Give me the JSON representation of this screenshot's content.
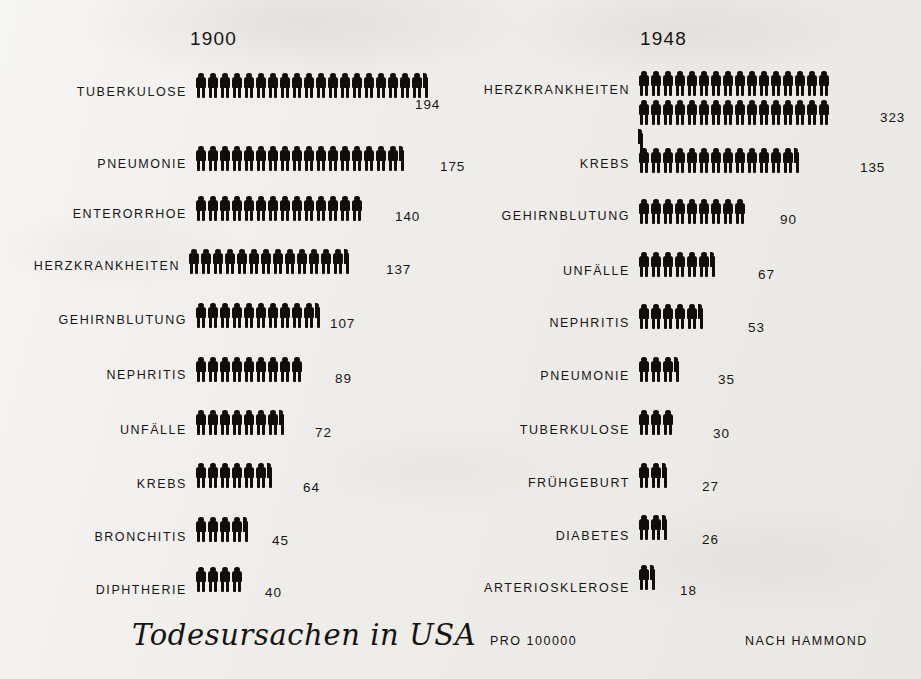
{
  "page": {
    "background_color": "#efedea",
    "ink_color": "#100e0c"
  },
  "headers": {
    "left": "1900",
    "right": "1948"
  },
  "footer": {
    "title": "Todesursachen in USA",
    "unit": "PRO 100000",
    "source": "NACH HAMMOND"
  },
  "chart_data": {
    "type": "bar",
    "subtype": "isotype-pictogram",
    "title": "Todesursachen in USA",
    "xlabel": "",
    "ylabel": "",
    "unit_note": "PRO 100000",
    "source_note": "NACH HAMMOND",
    "symbol": "human figure",
    "symbol_value": 10,
    "legend_position": "none",
    "grid": false,
    "series": [
      {
        "name": "1900",
        "categories": [
          "TUBERKULOSE",
          "PNEUMONIE",
          "ENTERORRHOE",
          "HERZKRANKHEITEN",
          "GEHIRNBLUTUNG",
          "NEPHRITIS",
          "UNFÄLLE",
          "KREBS",
          "BRONCHITIS",
          "DIPHTHERIE"
        ],
        "values": [
          194,
          175,
          140,
          137,
          107,
          89,
          72,
          64,
          45,
          40
        ]
      },
      {
        "name": "1948",
        "categories": [
          "HERZKRANKHEITEN",
          "KREBS",
          "GEHIRNBLUTUNG",
          "UNFÄLLE",
          "NEPHRITIS",
          "PNEUMONIE",
          "TUBERKULOSE",
          "FRÜHGEBURT",
          "DIABETES",
          "ARTERIOSKLEROSE"
        ],
        "values": [
          323,
          135,
          90,
          67,
          53,
          35,
          30,
          27,
          26,
          18
        ]
      }
    ]
  },
  "left_column": {
    "year": "1900",
    "rows": [
      {
        "label": "TUBERKULOSE",
        "value": "194",
        "full": 19,
        "half": 1,
        "top": 72,
        "fig_left": 195,
        "label_top": 86,
        "value_left": 415,
        "value_top": 97,
        "wrap": 0
      },
      {
        "label": "PNEUMONIE",
        "value": "175",
        "full": 17,
        "half": 1,
        "top": 145,
        "fig_left": 195,
        "label_top": 158,
        "value_left": 440,
        "value_top": 159,
        "wrap": 0
      },
      {
        "label": "ENTERORRHOE",
        "value": "140",
        "full": 14,
        "half": 0,
        "top": 195,
        "fig_left": 195,
        "label_top": 208,
        "value_left": 395,
        "value_top": 209,
        "wrap": 0
      },
      {
        "label": "HERZKRANKHEITEN",
        "value": "137",
        "full": 13,
        "half": 1,
        "top": 248,
        "fig_left": 188,
        "label_top": 260,
        "value_left": 386,
        "value_top": 262,
        "wrap": 0
      },
      {
        "label": "GEHIRNBLUTUNG",
        "value": "107",
        "full": 10,
        "half": 1,
        "top": 302,
        "fig_left": 195,
        "label_top": 314,
        "value_left": 330,
        "value_top": 316,
        "wrap": 0
      },
      {
        "label": "NEPHRITIS",
        "value": "89",
        "full": 9,
        "half": 0,
        "top": 356,
        "fig_left": 195,
        "label_top": 369,
        "value_left": 335,
        "value_top": 371,
        "wrap": 0
      },
      {
        "label": "UNFÄLLE",
        "value": "72",
        "full": 7,
        "half": 1,
        "top": 409,
        "fig_left": 195,
        "label_top": 424,
        "value_left": 315,
        "value_top": 425,
        "wrap": 0
      },
      {
        "label": "KREBS",
        "value": "64",
        "full": 6,
        "half": 1,
        "top": 462,
        "fig_left": 195,
        "label_top": 478,
        "value_left": 303,
        "value_top": 480,
        "wrap": 0
      },
      {
        "label": "BRONCHITIS",
        "value": "45",
        "full": 4,
        "half": 1,
        "top": 516,
        "fig_left": 195,
        "label_top": 531,
        "value_left": 272,
        "value_top": 533,
        "wrap": 0
      },
      {
        "label": "DIPHTHERIE",
        "value": "40",
        "full": 4,
        "half": 0,
        "top": 566,
        "fig_left": 195,
        "label_top": 584,
        "value_left": 265,
        "value_top": 585,
        "wrap": 0
      }
    ]
  },
  "right_column": {
    "year": "1948",
    "rows": [
      {
        "label": "HERZKRANKHEITEN",
        "value": "323",
        "full": 32,
        "half": 1,
        "top": 70,
        "fig_left": 168,
        "label_top": 84,
        "value_left": 410,
        "value_top": 110,
        "wrap": 16
      },
      {
        "label": "KREBS",
        "value": "135",
        "full": 13,
        "half": 1,
        "top": 147,
        "fig_left": 168,
        "label_top": 158,
        "value_left": 390,
        "value_top": 160,
        "wrap": 0
      },
      {
        "label": "GEHIRNBLUTUNG",
        "value": "90",
        "full": 9,
        "half": 0,
        "top": 198,
        "fig_left": 168,
        "label_top": 210,
        "value_left": 310,
        "value_top": 212,
        "wrap": 0
      },
      {
        "label": "UNFÄLLE",
        "value": "67",
        "full": 6,
        "half": 1,
        "top": 251,
        "fig_left": 168,
        "label_top": 265,
        "value_left": 288,
        "value_top": 267,
        "wrap": 0
      },
      {
        "label": "NEPHRITIS",
        "value": "53",
        "full": 5,
        "half": 1,
        "top": 303,
        "fig_left": 168,
        "label_top": 317,
        "value_left": 278,
        "value_top": 320,
        "wrap": 0
      },
      {
        "label": "PNEUMONIE",
        "value": "35",
        "full": 3,
        "half": 1,
        "top": 356,
        "fig_left": 168,
        "label_top": 370,
        "value_left": 248,
        "value_top": 372,
        "wrap": 0
      },
      {
        "label": "TUBERKULOSE",
        "value": "30",
        "full": 3,
        "half": 0,
        "top": 409,
        "fig_left": 168,
        "label_top": 424,
        "value_left": 243,
        "value_top": 426,
        "wrap": 0
      },
      {
        "label": "FRÜHGEBURT",
        "value": "27",
        "full": 2,
        "half": 1,
        "top": 462,
        "fig_left": 168,
        "label_top": 477,
        "value_left": 232,
        "value_top": 479,
        "wrap": 0
      },
      {
        "label": "DIABETES",
        "value": "26",
        "full": 2,
        "half": 1,
        "top": 514,
        "fig_left": 168,
        "label_top": 530,
        "value_left": 232,
        "value_top": 532,
        "wrap": 0
      },
      {
        "label": "ARTERIOSKLEROSE",
        "value": "18",
        "full": 1,
        "half": 1,
        "top": 564,
        "fig_left": 168,
        "label_top": 582,
        "value_left": 210,
        "value_top": 583,
        "wrap": 0
      }
    ]
  }
}
